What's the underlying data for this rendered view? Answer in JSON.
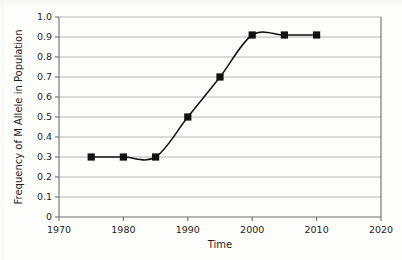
{
  "chart_data": {
    "type": "line",
    "title": "",
    "subtitle": "",
    "xlabel": "Time",
    "ylabel": "Frequency of M Allele in Population",
    "xlim": [
      1970,
      2020
    ],
    "ylim": [
      0,
      1.0
    ],
    "grid": "horizontal",
    "legend": "none",
    "x": [
      1975,
      1980,
      1985,
      1990,
      1995,
      2000,
      2005,
      2010
    ],
    "values": [
      0.3,
      0.3,
      0.3,
      0.5,
      0.7,
      0.91,
      0.91,
      0.91
    ],
    "series": [
      {
        "name": "M allele frequency",
        "marker": "filled-square",
        "line_color": "#111111",
        "marker_color": "#111111",
        "smoothed": true,
        "values": [
          0.3,
          0.3,
          0.3,
          0.5,
          0.7,
          0.91,
          0.91,
          0.91
        ]
      }
    ],
    "x_tick_labels": [
      "1970",
      "1980",
      "1990",
      "2000",
      "2010",
      "2020"
    ],
    "x_tick_values": [
      1970,
      1980,
      1990,
      2000,
      2010,
      2020
    ],
    "y_tick_labels": [
      "0",
      "0.1",
      "0.2",
      "0.3",
      "0.4",
      "0.5",
      "0.6",
      "0.7",
      "0.8",
      "0.9",
      "1.0"
    ],
    "y_tick_values": [
      0,
      0.1,
      0.2,
      0.3,
      0.4,
      0.5,
      0.6,
      0.7,
      0.8,
      0.9,
      1.0
    ],
    "colors": {
      "background": "#fdfdfc",
      "gridline": "#b4b4b4",
      "axis": "#6e6e6e",
      "series": "#111111",
      "text": "#1d1d1d"
    }
  }
}
